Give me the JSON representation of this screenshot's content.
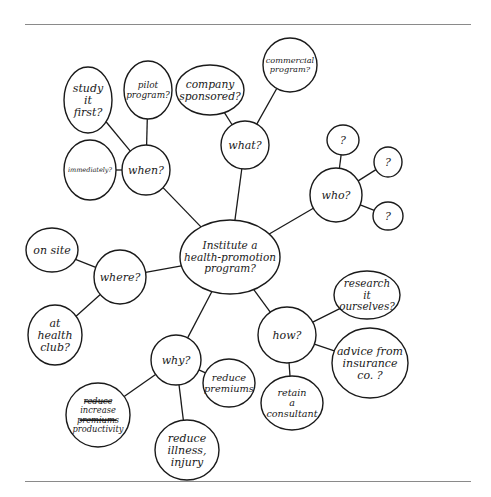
{
  "diagram": {
    "type": "mind-map",
    "style": "hand-drawn",
    "rules": {
      "top_y": 24,
      "bottom_y": 481,
      "color": "#8a8a8a"
    },
    "stroke_color": "#1a1a1a",
    "center": {
      "id": "center",
      "lines": [
        "Institute a",
        "health-promotion",
        "program?"
      ],
      "x": 230,
      "y": 257,
      "rx": 50,
      "ry": 37
    },
    "branches": [
      {
        "id": "when",
        "lines": [
          "when?"
        ],
        "x": 146,
        "y": 170,
        "rx": 24,
        "ry": 25,
        "children": [
          {
            "id": "study-it-first",
            "lines": [
              "study",
              "it",
              "first?"
            ],
            "x": 88,
            "y": 100,
            "rx": 24,
            "ry": 33
          },
          {
            "id": "pilot-program",
            "lines": [
              "pilot",
              "program?"
            ],
            "x": 148,
            "y": 90,
            "rx": 24,
            "ry": 29
          },
          {
            "id": "immediately",
            "lines": [
              "immediately?"
            ],
            "x": 90,
            "y": 170,
            "rx": 26,
            "ry": 30
          }
        ]
      },
      {
        "id": "what",
        "lines": [
          "what?"
        ],
        "x": 245,
        "y": 145,
        "rx": 24,
        "ry": 24,
        "children": [
          {
            "id": "company-sponsored",
            "lines": [
              "company",
              "sponsored?"
            ],
            "x": 210,
            "y": 90,
            "rx": 34,
            "ry": 25
          },
          {
            "id": "commercial-program",
            "lines": [
              "commercial",
              "program?"
            ],
            "x": 290,
            "y": 65,
            "rx": 27,
            "ry": 27
          }
        ]
      },
      {
        "id": "who",
        "lines": [
          "who?"
        ],
        "x": 336,
        "y": 195,
        "rx": 26,
        "ry": 27,
        "children": [
          {
            "id": "who-unknown-1",
            "lines": [
              "?"
            ],
            "x": 343,
            "y": 140,
            "rx": 16,
            "ry": 15
          },
          {
            "id": "who-unknown-2",
            "lines": [
              "?"
            ],
            "x": 388,
            "y": 162,
            "rx": 14,
            "ry": 15
          },
          {
            "id": "who-unknown-3",
            "lines": [
              "?"
            ],
            "x": 388,
            "y": 216,
            "rx": 15,
            "ry": 14
          }
        ]
      },
      {
        "id": "where",
        "lines": [
          "where?"
        ],
        "x": 120,
        "y": 277,
        "rx": 26,
        "ry": 27,
        "children": [
          {
            "id": "on-site",
            "lines": [
              "on site"
            ],
            "x": 52,
            "y": 250,
            "rx": 26,
            "ry": 22
          },
          {
            "id": "at-health-club",
            "lines": [
              "at",
              "health",
              "club?"
            ],
            "x": 55,
            "y": 335,
            "rx": 27,
            "ry": 30
          }
        ]
      },
      {
        "id": "how",
        "lines": [
          "how?"
        ],
        "x": 287,
        "y": 335,
        "rx": 29,
        "ry": 28,
        "children": [
          {
            "id": "research-it-ourselves",
            "lines": [
              "research",
              "it",
              "ourselves?"
            ],
            "x": 367,
            "y": 295,
            "rx": 33,
            "ry": 24
          },
          {
            "id": "advice-from-insurance",
            "lines": [
              "advice from",
              "insurance",
              "co. ?"
            ],
            "x": 370,
            "y": 363,
            "rx": 38,
            "ry": 35
          },
          {
            "id": "retain-a-consultant",
            "lines": [
              "retain",
              "a",
              "consultant"
            ],
            "x": 292,
            "y": 403,
            "rx": 31,
            "ry": 27
          }
        ]
      },
      {
        "id": "why",
        "lines": [
          "why?"
        ],
        "x": 176,
        "y": 360,
        "rx": 25,
        "ry": 25,
        "children": [
          {
            "id": "reduce-premiums",
            "lines": [
              "reduce",
              "premiums"
            ],
            "x": 229,
            "y": 383,
            "rx": 26,
            "ry": 24
          },
          {
            "id": "reduce-illness-injury",
            "lines": [
              "reduce",
              "illness,",
              "injury"
            ],
            "x": 187,
            "y": 450,
            "rx": 32,
            "ry": 30
          },
          {
            "id": "increase-productivity",
            "lines": [
              "reduce",
              "increase",
              "premiums",
              "productivity"
            ],
            "struck_lines": [
              0,
              2
            ],
            "x": 98,
            "y": 415,
            "rx": 32,
            "ry": 32
          }
        ]
      }
    ]
  }
}
